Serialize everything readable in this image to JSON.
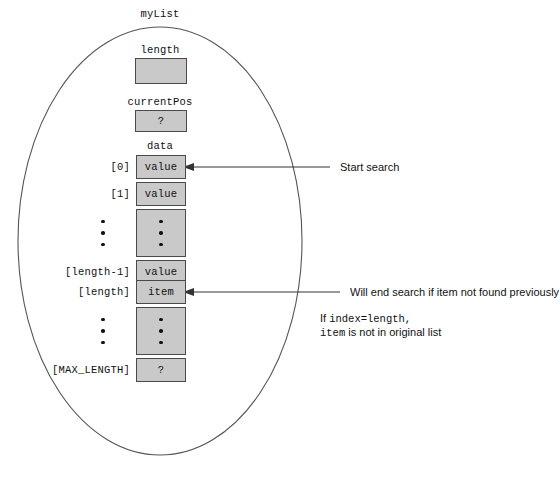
{
  "diagram": {
    "title": "myList",
    "container_shape": "ellipse",
    "fields": [
      {
        "name": "length",
        "label": "length",
        "value": ""
      },
      {
        "name": "currentPos",
        "label": "currentPos",
        "value": "?"
      },
      {
        "name": "data",
        "label": "data",
        "value": ""
      }
    ],
    "array": {
      "label": "data",
      "cells": [
        {
          "index": "[0]",
          "value": "value",
          "kind": "value"
        },
        {
          "index": "[1]",
          "value": "value",
          "kind": "value"
        },
        {
          "index": "",
          "value": "",
          "kind": "ellipsis"
        },
        {
          "index": "[length-1]",
          "value": "value",
          "kind": "value"
        },
        {
          "index": "[length]",
          "value": "item",
          "kind": "value"
        },
        {
          "index": "",
          "value": "",
          "kind": "ellipsis"
        },
        {
          "index": "[MAX_LENGTH]",
          "value": "?",
          "kind": "value"
        }
      ]
    },
    "annotations": [
      {
        "name": "start-search",
        "text": "Start search",
        "target_index": "[0]"
      },
      {
        "name": "end-search",
        "text": "Will end search if item not found previously",
        "target_index": "[length]"
      }
    ],
    "note": {
      "line1_prefix": "If ",
      "line1_code": "index=length,",
      "line2_code": "item",
      "line2_suffix": " is not in original list"
    },
    "colors": {
      "cell_fill": "#c9c9c9",
      "cell_border": "#4a4a4a",
      "ellipse_stroke": "#555555",
      "arrow": "#333333",
      "text": "#111111",
      "background": "#ffffff"
    }
  }
}
